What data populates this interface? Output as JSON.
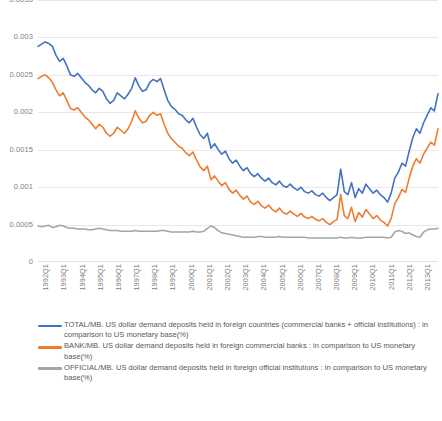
{
  "chart_data": {
    "type": "line",
    "title": "",
    "xlabel": "",
    "ylabel": "",
    "ylim": [
      0,
      0.0035
    ],
    "grid": true,
    "legend_position": "bottom",
    "ytick_labels": [
      "0.0035",
      "0.003",
      "0.0025",
      "0.002",
      "0.0015",
      "0.001",
      "0.0005",
      "0"
    ],
    "ytick_values": [
      0.0035,
      0.003,
      0.0025,
      0.002,
      0.0015,
      0.001,
      0.0005,
      0
    ],
    "xtick_labels": [
      "1992Q1",
      "1993Q1",
      "1994Q1",
      "1995Q1",
      "1996Q1",
      "1997Q1",
      "1998Q1",
      "1999Q1",
      "2000Q1",
      "2001Q1",
      "2002Q1",
      "2003Q1",
      "2004Q1",
      "2005Q1",
      "2006Q1",
      "2007Q1",
      "2008Q1",
      "2009Q1",
      "2010Q1",
      "2011Q1",
      "2012Q1",
      "2013Q1",
      "2014Q1"
    ],
    "series": [
      {
        "name": "TOTAL/MB. US dollar demand deposits held in foreign countries (commercial banks + official institutions) : in comparison to US monetary base(%)",
        "short_name": "TOTAL/MB",
        "color": "#4472C4",
        "values": [
          0.00288,
          0.00291,
          0.00294,
          0.00292,
          0.00288,
          0.00276,
          0.00268,
          0.00272,
          0.00262,
          0.0025,
          0.00248,
          0.00252,
          0.00246,
          0.0024,
          0.00236,
          0.0023,
          0.00226,
          0.00232,
          0.00228,
          0.00218,
          0.00212,
          0.00216,
          0.00226,
          0.00222,
          0.00218,
          0.00224,
          0.00232,
          0.00246,
          0.00235,
          0.00228,
          0.0023,
          0.0024,
          0.00244,
          0.00241,
          0.00245,
          0.0023,
          0.00216,
          0.00208,
          0.00204,
          0.00198,
          0.00196,
          0.0019,
          0.00186,
          0.00192,
          0.0018,
          0.0017,
          0.00165,
          0.00172,
          0.00152,
          0.00158,
          0.0015,
          0.00144,
          0.00148,
          0.00138,
          0.00132,
          0.00136,
          0.00128,
          0.00122,
          0.00126,
          0.00118,
          0.00114,
          0.00118,
          0.00112,
          0.00108,
          0.00112,
          0.00106,
          0.00103,
          0.00108,
          0.00102,
          0.001,
          0.00104,
          0.00099,
          0.00096,
          0.001,
          0.00094,
          0.00092,
          0.00095,
          0.0009,
          0.00088,
          0.00092,
          0.00086,
          0.00082,
          0.00086,
          0.0009,
          0.00124,
          0.00094,
          0.0009,
          0.00106,
          0.00086,
          0.00098,
          0.00092,
          0.00104,
          0.00098,
          0.00092,
          0.00096,
          0.0009,
          0.00086,
          0.0008,
          0.00092,
          0.00112,
          0.0012,
          0.00132,
          0.00128,
          0.00148,
          0.00166,
          0.00178,
          0.00172,
          0.00186,
          0.00196,
          0.00206,
          0.00202,
          0.00225
        ]
      },
      {
        "name": "BANK/MB. US dollar demand deposits held in foreign commercial banks : in comparison to US monetary base(%)",
        "short_name": "BANK/MB",
        "color": "#ED7D31",
        "values": [
          0.00245,
          0.00248,
          0.0025,
          0.00246,
          0.0024,
          0.0023,
          0.00222,
          0.00226,
          0.00216,
          0.00205,
          0.00203,
          0.00206,
          0.002,
          0.00194,
          0.0019,
          0.00184,
          0.00178,
          0.00184,
          0.0018,
          0.00172,
          0.00168,
          0.00172,
          0.0018,
          0.00176,
          0.00172,
          0.00178,
          0.00188,
          0.00202,
          0.00192,
          0.00186,
          0.00188,
          0.00196,
          0.002,
          0.00196,
          0.00198,
          0.00184,
          0.00172,
          0.00165,
          0.0016,
          0.00155,
          0.00152,
          0.00146,
          0.00142,
          0.00147,
          0.00136,
          0.00127,
          0.00122,
          0.00128,
          0.0011,
          0.00115,
          0.00108,
          0.00102,
          0.00106,
          0.00097,
          0.00092,
          0.00096,
          0.00089,
          0.00084,
          0.00088,
          0.0008,
          0.00077,
          0.00081,
          0.00075,
          0.00072,
          0.00076,
          0.0007,
          0.00067,
          0.00072,
          0.00066,
          0.00064,
          0.00068,
          0.00064,
          0.00061,
          0.00065,
          0.0006,
          0.00058,
          0.00061,
          0.00057,
          0.00055,
          0.00058,
          0.00053,
          0.0005,
          0.00054,
          0.00057,
          0.0009,
          0.00062,
          0.00058,
          0.00073,
          0.00054,
          0.00066,
          0.0006,
          0.0007,
          0.00064,
          0.00058,
          0.00062,
          0.00056,
          0.00053,
          0.00048,
          0.00058,
          0.00078,
          0.00086,
          0.00097,
          0.00093,
          0.00112,
          0.00128,
          0.00138,
          0.00132,
          0.00144,
          0.00152,
          0.0016,
          0.00156,
          0.00178
        ]
      },
      {
        "name": "OFFICIAL/MB. US dollar demand deposits held in foreign official institutions : in comparison to US monetary base(%)",
        "short_name": "OFFICIAL/MB",
        "color": "#A5A5A5",
        "values": [
          0.00048,
          0.00047,
          0.00048,
          0.00049,
          0.00046,
          0.00047,
          0.00049,
          0.00048,
          0.00046,
          0.00045,
          0.00045,
          0.00044,
          0.00044,
          0.00044,
          0.00043,
          0.00043,
          0.00044,
          0.00045,
          0.00044,
          0.00043,
          0.00042,
          0.00042,
          0.00042,
          0.00041,
          0.00041,
          0.00041,
          0.00041,
          0.00042,
          0.00041,
          0.00041,
          0.00041,
          0.00041,
          0.00041,
          0.00041,
          0.00042,
          0.00042,
          0.00041,
          0.0004,
          0.0004,
          0.0004,
          0.0004,
          0.0004,
          0.0004,
          0.00041,
          0.0004,
          0.0004,
          0.00041,
          0.00045,
          0.00048,
          0.00046,
          0.00042,
          0.00039,
          0.00038,
          0.00037,
          0.00036,
          0.00035,
          0.00034,
          0.00033,
          0.00033,
          0.00033,
          0.00033,
          0.00034,
          0.00034,
          0.00033,
          0.00033,
          0.00033,
          0.00033,
          0.00034,
          0.00033,
          0.00033,
          0.00033,
          0.00033,
          0.00033,
          0.00033,
          0.00033,
          0.00032,
          0.00032,
          0.00032,
          0.00032,
          0.00032,
          0.00032,
          0.00032,
          0.00032,
          0.00032,
          0.00033,
          0.00032,
          0.00032,
          0.00033,
          0.00032,
          0.00032,
          0.00032,
          0.00033,
          0.00033,
          0.00033,
          0.00033,
          0.00033,
          0.00033,
          0.00032,
          0.00033,
          0.0004,
          0.00042,
          0.00041,
          0.00038,
          0.00039,
          0.00036,
          0.00034,
          0.00033,
          0.0004,
          0.00043,
          0.00044,
          0.00044,
          0.00045
        ]
      }
    ]
  },
  "legend": {
    "items": [
      {
        "label": "TOTAL/MB. US dollar demand deposits held in foreign countries (commercial banks + official institutions) : in comparison to US monetary base(%)",
        "color": "#4472C4"
      },
      {
        "label": "BANK/MB. US dollar demand deposits held in foreign commercial banks : in comparison to US monetary base(%)",
        "color": "#ED7D31"
      },
      {
        "label": "OFFICIAL/MB. US dollar demand deposits held in foreign official institutions : in comparison to US monetary base(%)",
        "color": "#A5A5A5"
      }
    ]
  },
  "colors": {
    "total": "#4472C4",
    "bank": "#ED7D31",
    "official": "#A5A5A5",
    "gridline": "#e8e8e8",
    "axis_text": "#808080",
    "legend_text": "#595959"
  }
}
